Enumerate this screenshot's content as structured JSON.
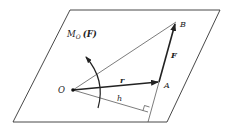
{
  "diagram": {
    "type": "moment-of-force-about-point",
    "labels": {
      "moment": "M",
      "moment_sub": "O",
      "moment_arg": "(F)",
      "point_o": "O",
      "point_a": "A",
      "point_b": "B",
      "force": "F",
      "position_vector": "r",
      "lever_arm": "h"
    },
    "colors": {
      "line": "#333333",
      "background": "#ffffff"
    }
  }
}
